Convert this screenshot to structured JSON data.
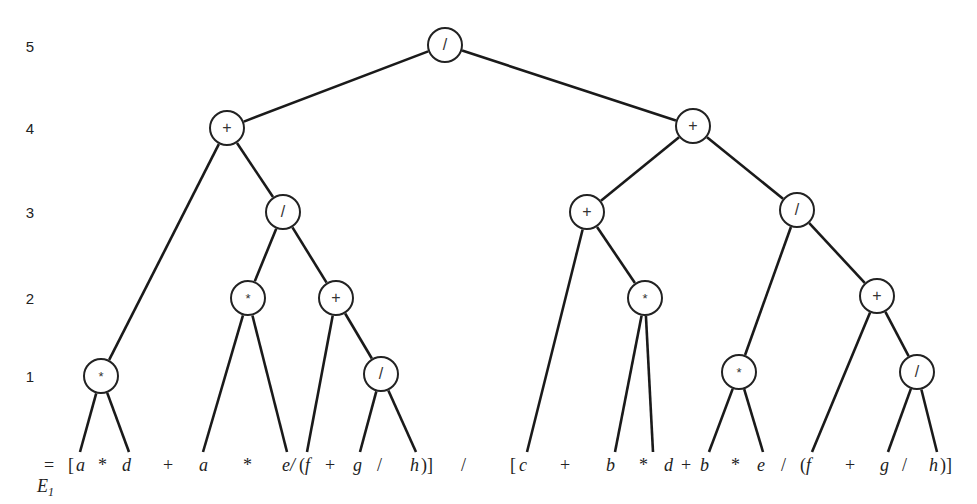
{
  "level_labels": [
    "5",
    "4",
    "3",
    "2",
    "1"
  ],
  "tree": {
    "nodes": [
      {
        "id": "n5",
        "level": 5,
        "op": "/",
        "x": 445,
        "y": 45
      },
      {
        "id": "n4a",
        "level": 4,
        "op": "+",
        "x": 227,
        "y": 128
      },
      {
        "id": "n4b",
        "level": 4,
        "op": "+",
        "x": 693,
        "y": 126
      },
      {
        "id": "n3a",
        "level": 3,
        "op": "/",
        "x": 283,
        "y": 212
      },
      {
        "id": "n3b",
        "level": 3,
        "op": "+",
        "x": 587,
        "y": 212
      },
      {
        "id": "n3c",
        "level": 3,
        "op": "/",
        "x": 797,
        "y": 210
      },
      {
        "id": "n2a",
        "level": 2,
        "op": "*",
        "x": 248,
        "y": 298
      },
      {
        "id": "n2b",
        "level": 2,
        "op": "+",
        "x": 336,
        "y": 298
      },
      {
        "id": "n2c",
        "level": 2,
        "op": "*",
        "x": 645,
        "y": 298
      },
      {
        "id": "n2d",
        "level": 2,
        "op": "+",
        "x": 877,
        "y": 296
      },
      {
        "id": "n1a",
        "level": 1,
        "op": "*",
        "x": 101,
        "y": 376
      },
      {
        "id": "n1b",
        "level": 1,
        "op": "/",
        "x": 381,
        "y": 374
      },
      {
        "id": "n1c",
        "level": 1,
        "op": "*",
        "x": 739,
        "y": 372
      },
      {
        "id": "n1d",
        "level": 1,
        "op": "/",
        "x": 917,
        "y": 372
      }
    ],
    "leaves": [
      {
        "id": "l1",
        "name": "a",
        "x": 80
      },
      {
        "id": "l2",
        "name": "d",
        "x": 129
      },
      {
        "id": "l3",
        "name": "a",
        "x": 203
      },
      {
        "id": "l4",
        "name": "e",
        "x": 287
      },
      {
        "id": "l5",
        "name": "f",
        "x": 307
      },
      {
        "id": "l6",
        "name": "g",
        "x": 360
      },
      {
        "id": "l7",
        "name": "h",
        "x": 416
      },
      {
        "id": "l8",
        "name": "c",
        "x": 527
      },
      {
        "id": "l9",
        "name": "b",
        "x": 615
      },
      {
        "id": "l10",
        "name": "d",
        "x": 653
      },
      {
        "id": "l11",
        "name": "b",
        "x": 709
      },
      {
        "id": "l12",
        "name": "e",
        "x": 763
      },
      {
        "id": "l13",
        "name": "f",
        "x": 812
      },
      {
        "id": "l14",
        "name": "g",
        "x": 888
      },
      {
        "id": "l15",
        "name": "h",
        "x": 937
      }
    ],
    "edges": [
      [
        "n5",
        "n4a"
      ],
      [
        "n5",
        "n4b"
      ],
      [
        "n4a",
        "n1a"
      ],
      [
        "n4a",
        "n3a"
      ],
      [
        "n3a",
        "n2a"
      ],
      [
        "n3a",
        "n2b"
      ],
      [
        "n2b",
        "l5"
      ],
      [
        "n2b",
        "n1b"
      ],
      [
        "n1b",
        "l6"
      ],
      [
        "n1b",
        "l7"
      ],
      [
        "n2a",
        "l3"
      ],
      [
        "n2a",
        "l4"
      ],
      [
        "n1a",
        "l1"
      ],
      [
        "n1a",
        "l2"
      ],
      [
        "n4b",
        "n3b"
      ],
      [
        "n4b",
        "n3c"
      ],
      [
        "n3b",
        "l8"
      ],
      [
        "n3b",
        "n2c"
      ],
      [
        "n2c",
        "l9"
      ],
      [
        "n2c",
        "l10"
      ],
      [
        "n3c",
        "n1c"
      ],
      [
        "n3c",
        "n2d"
      ],
      [
        "n1c",
        "l11"
      ],
      [
        "n1c",
        "l12"
      ],
      [
        "n2d",
        "l13"
      ],
      [
        "n2d",
        "n1d"
      ],
      [
        "n1d",
        "l14"
      ],
      [
        "n1d",
        "l15"
      ]
    ]
  },
  "expression": {
    "label": "E",
    "subscript": "1",
    "equals": "=",
    "tokens": [
      {
        "t": "[",
        "x": 68,
        "var": false
      },
      {
        "t": "a",
        "x": 76,
        "var": true
      },
      {
        "t": "*",
        "x": 98,
        "var": false
      },
      {
        "t": "d",
        "x": 122,
        "var": true
      },
      {
        "t": "+",
        "x": 163,
        "var": false
      },
      {
        "t": "a",
        "x": 199,
        "var": true
      },
      {
        "t": "*",
        "x": 243,
        "var": false
      },
      {
        "t": "e/",
        "x": 282,
        "var": true
      },
      {
        "t": "(",
        "x": 299,
        "var": false
      },
      {
        "t": "f",
        "x": 305,
        "var": true
      },
      {
        "t": "+",
        "x": 325,
        "var": false
      },
      {
        "t": "g",
        "x": 353,
        "var": true
      },
      {
        "t": "/",
        "x": 377,
        "var": false
      },
      {
        "t": "h",
        "x": 410,
        "var": true
      },
      {
        "t": ")]",
        "x": 421,
        "var": false
      },
      {
        "t": "/",
        "x": 461,
        "var": false
      },
      {
        "t": "[",
        "x": 510,
        "var": false
      },
      {
        "t": "c",
        "x": 519,
        "var": true
      },
      {
        "t": "+",
        "x": 560,
        "var": false
      },
      {
        "t": "b",
        "x": 606,
        "var": true
      },
      {
        "t": "*",
        "x": 639,
        "var": false
      },
      {
        "t": "d",
        "x": 664,
        "var": true
      },
      {
        "t": "+",
        "x": 681,
        "var": false
      },
      {
        "t": "b",
        "x": 700,
        "var": true
      },
      {
        "t": "*",
        "x": 731,
        "var": false
      },
      {
        "t": "e",
        "x": 757,
        "var": true
      },
      {
        "t": "/",
        "x": 781,
        "var": false
      },
      {
        "t": "(",
        "x": 800,
        "var": false
      },
      {
        "t": "f",
        "x": 806,
        "var": true
      },
      {
        "t": "+",
        "x": 845,
        "var": false
      },
      {
        "t": "g",
        "x": 880,
        "var": true
      },
      {
        "t": "/",
        "x": 902,
        "var": false
      },
      {
        "t": "h",
        "x": 929,
        "var": true
      },
      {
        "t": ")]",
        "x": 940,
        "var": false
      }
    ]
  }
}
